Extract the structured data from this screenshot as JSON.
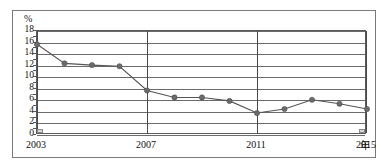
{
  "chart_data": {
    "type": "line",
    "title": "",
    "xlabel": "年",
    "ylabel": "%",
    "x": [
      2003,
      2004,
      2005,
      2006,
      2007,
      2008,
      2009,
      2010,
      2011,
      2012,
      2013,
      2014,
      2015
    ],
    "values": [
      15.7,
      12.4,
      12.1,
      11.9,
      7.7,
      6.5,
      6.5,
      5.9,
      3.8,
      4.5,
      6.1,
      5.4,
      4.5
    ],
    "categories": [
      "2003",
      "2004",
      "2005",
      "2006",
      "2007",
      "2008",
      "2009",
      "2010",
      "2011",
      "2012",
      "2013",
      "2014",
      "2015"
    ],
    "ylim": [
      0,
      18
    ],
    "xlim": [
      2003,
      2015
    ],
    "ytick_labels": [
      "18",
      "16",
      "14",
      "12",
      "10",
      "8",
      "6",
      "4",
      "2",
      "0"
    ],
    "ytick_values": [
      18,
      16,
      14,
      12,
      10,
      8,
      6,
      4,
      2,
      0
    ],
    "xtick_labels": [
      "2003",
      "2007",
      "2011",
      "2015"
    ],
    "xtick_values": [
      2003,
      2007,
      2011,
      2015
    ],
    "grid": "horizontal",
    "legend": "none",
    "series_color": "#6b6b6b",
    "grid_color": "#6b6b6b",
    "vertical_separators": [
      2003,
      2007,
      2011,
      2015
    ]
  },
  "axis": {
    "unit_y": "%",
    "unit_x": "年"
  },
  "ticks": {
    "y": [
      {
        "label": "18",
        "value": 18
      },
      {
        "label": "16",
        "value": 16
      },
      {
        "label": "14",
        "value": 14
      },
      {
        "label": "12",
        "value": 12
      },
      {
        "label": "10",
        "value": 10
      },
      {
        "label": "8",
        "value": 8
      },
      {
        "label": "6",
        "value": 6
      },
      {
        "label": "4",
        "value": 4
      },
      {
        "label": "2",
        "value": 2
      },
      {
        "label": "0",
        "value": 0
      }
    ],
    "x": [
      {
        "label": "2003",
        "value": 2003
      },
      {
        "label": "2007",
        "value": 2007
      },
      {
        "label": "2011",
        "value": 2011
      },
      {
        "label": "2015",
        "value": 2015
      }
    ]
  }
}
